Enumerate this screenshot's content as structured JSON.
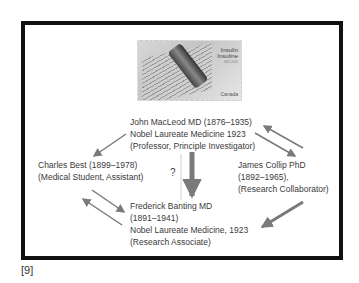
{
  "stamp": {
    "title_en": "Insulin",
    "title_fr": "Insuline",
    "years": "1921-2021",
    "country": "Canada"
  },
  "nodes": {
    "macleod": {
      "line1": "John MacLeod MD (1876–1935)",
      "line2": "Nobel Laureate Medicine 1923",
      "line3": "(Professor, Principle Investigator)"
    },
    "best": {
      "line1": "Charles Best (1899–1978)",
      "line2": "(Medical Student, Assistant)"
    },
    "collip": {
      "line1": "James Collip PhD",
      "line2": "(1892–1965),",
      "line3": "(Research Collaborator)"
    },
    "banting": {
      "line1": "Frederick Banting MD",
      "line2": "(1891–1941)",
      "line3": "Nobel Laureate Medicine, 1923",
      "line4": "(Research Associate)"
    }
  },
  "question_mark": "?",
  "reference": "[9]",
  "colors": {
    "arrow": "#7a7a7a",
    "border": "#111111",
    "text": "#3a3a3a"
  }
}
